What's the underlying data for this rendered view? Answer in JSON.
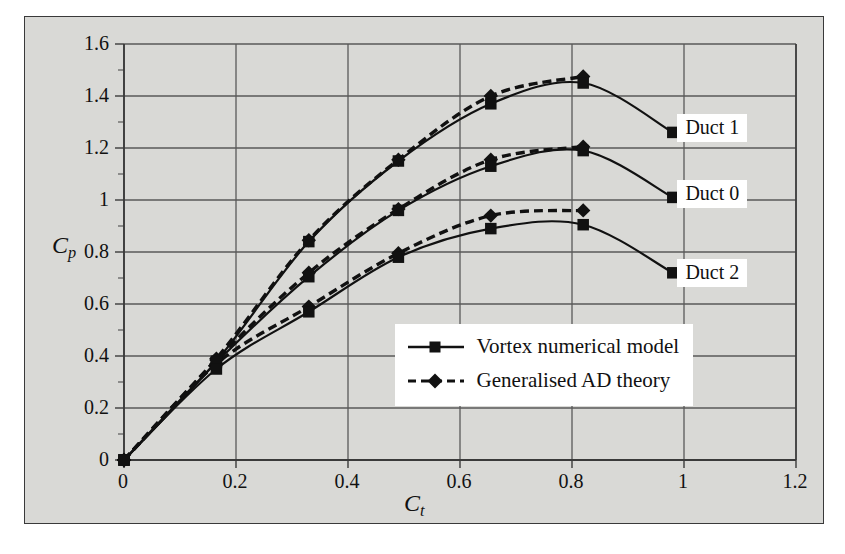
{
  "chart_data": {
    "type": "line",
    "title": "",
    "xlabel": "Ct",
    "ylabel": "Cp",
    "xlabel_base": "C",
    "xlabel_sub": "t",
    "ylabel_base": "C",
    "ylabel_sub": "p",
    "xlim": [
      0,
      1.2
    ],
    "ylim": [
      0,
      1.6
    ],
    "xticks": [
      "0",
      "0.2",
      "0.4",
      "0.6",
      "0.8",
      "1",
      "1.2"
    ],
    "xtick_values": [
      0,
      0.2,
      0.4,
      0.6,
      0.8,
      1,
      1.2
    ],
    "yticks": [
      "0",
      "0.2",
      "0.4",
      "0.6",
      "0.8",
      "1",
      "1.2",
      "1.4",
      "1.6"
    ],
    "ytick_values": [
      0,
      0.2,
      0.4,
      0.6,
      0.8,
      1,
      1.2,
      1.4,
      1.6
    ],
    "grid": true,
    "minor_ticks_y": true,
    "legend_position": "inside-lower-right",
    "series": [
      {
        "name": "Duct 1 - Vortex numerical model",
        "group": "Duct 1",
        "style": "solid",
        "marker": "square",
        "x": [
          0,
          0.165,
          0.33,
          0.49,
          0.655,
          0.82,
          0.98
        ],
        "values": [
          0,
          0.38,
          0.84,
          1.15,
          1.37,
          1.45,
          1.26
        ]
      },
      {
        "name": "Duct 1 - Generalised AD theory",
        "group": "Duct 1",
        "style": "dashed",
        "marker": "diamond",
        "x": [
          0,
          0.165,
          0.33,
          0.49,
          0.655,
          0.82
        ],
        "values": [
          0,
          0.39,
          0.845,
          1.155,
          1.4,
          1.475
        ]
      },
      {
        "name": "Duct 0 - Vortex numerical model",
        "group": "Duct 0",
        "style": "solid",
        "marker": "square",
        "x": [
          0,
          0.165,
          0.33,
          0.49,
          0.655,
          0.82,
          0.98
        ],
        "values": [
          0,
          0.375,
          0.705,
          0.96,
          1.13,
          1.19,
          1.01
        ]
      },
      {
        "name": "Duct 0 - Generalised AD theory",
        "group": "Duct 0",
        "style": "dashed",
        "marker": "diamond",
        "x": [
          0,
          0.165,
          0.33,
          0.49,
          0.655,
          0.82
        ],
        "values": [
          0,
          0.385,
          0.72,
          0.965,
          1.155,
          1.205
        ]
      },
      {
        "name": "Duct 2 - Vortex numerical model",
        "group": "Duct 2",
        "style": "solid",
        "marker": "square",
        "x": [
          0,
          0.165,
          0.33,
          0.49,
          0.655,
          0.82,
          0.98
        ],
        "values": [
          0,
          0.35,
          0.57,
          0.78,
          0.89,
          0.905,
          0.72
        ]
      },
      {
        "name": "Duct 2 - Generalised AD theory",
        "group": "Duct 2",
        "style": "dashed",
        "marker": "diamond",
        "x": [
          0,
          0.165,
          0.33,
          0.49,
          0.655,
          0.82
        ],
        "values": [
          0,
          0.37,
          0.59,
          0.795,
          0.94,
          0.96
        ]
      }
    ],
    "annotations": [
      {
        "label": "Duct 1",
        "x": 0.99,
        "y": 1.275
      },
      {
        "label": "Duct 0",
        "x": 0.99,
        "y": 1.02
      },
      {
        "label": "Duct 2",
        "x": 0.99,
        "y": 0.715
      }
    ],
    "legend": [
      {
        "label": "Vortex numerical model",
        "style": "solid",
        "marker": "square"
      },
      {
        "label": "Generalised AD theory",
        "style": "dashed",
        "marker": "diamond"
      }
    ],
    "colors": {
      "plot_background": "#d9d9d6",
      "grid": "#595959",
      "axis": "#3a3a3a",
      "series": "#111111",
      "text": "#111111",
      "callout_background": "#ffffff"
    }
  }
}
